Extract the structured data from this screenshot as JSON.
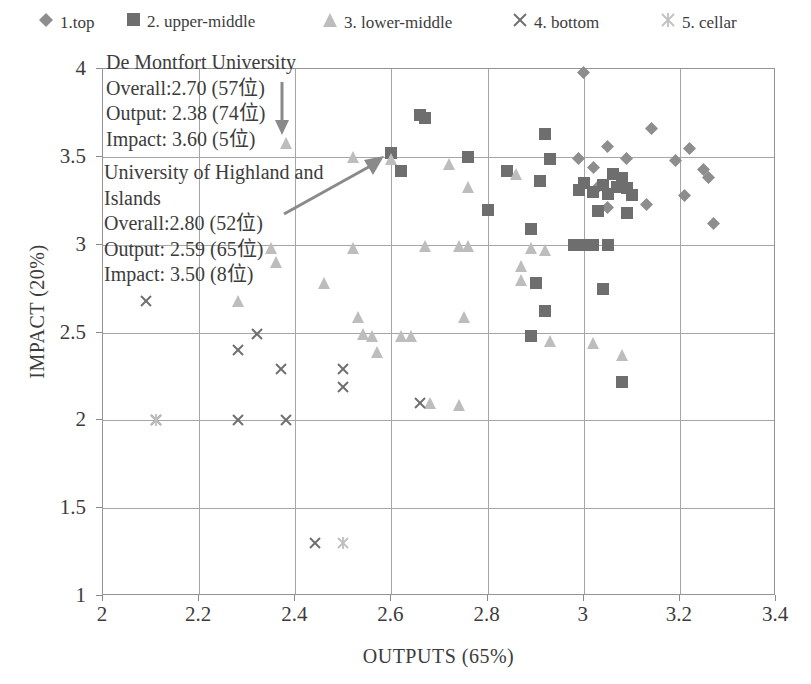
{
  "legend": {
    "items": [
      {
        "label": "1.top",
        "marker": "diamond-marker",
        "color": "#8d8d8d",
        "x": 38
      },
      {
        "label": "2. upper-middle",
        "marker": "square-marker",
        "color": "#6e6e6e",
        "x": 126
      },
      {
        "label": "3. lower-middle",
        "marker": "triangle-marker",
        "color": "#bdbdbd",
        "x": 322
      },
      {
        "label": "4. bottom",
        "marker": "cross-marker",
        "color": "#6f6f6f",
        "x": 512
      },
      {
        "label": "5. cellar",
        "marker": "asterisk-marker",
        "color": "#bfbfbf",
        "x": 660
      }
    ]
  },
  "annotations": [
    {
      "name": "de-montfort-university",
      "lines": [
        "De Montfort University",
        "Overall:2.70 (57位)",
        "Output: 2.38 (74位)",
        "Impact: 3.60 (5位)"
      ]
    },
    {
      "name": "university-of-highland-and-islands",
      "lines": [
        "University of Highland and",
        "Islands",
        "Overall:2.80 (52位)",
        "Output: 2.59 (65位)",
        "Impact: 3.50 (8位)"
      ]
    }
  ],
  "chart_data": {
    "type": "scatter",
    "title": "",
    "xlabel": "OUTPUTS (65%)",
    "ylabel": "IMPACT (20%)",
    "xlim": [
      2,
      3.4
    ],
    "ylim": [
      1,
      4
    ],
    "xticks": [
      2,
      2.2,
      2.4,
      2.6,
      2.8,
      3,
      3.2,
      3.4
    ],
    "xtick_labels": [
      "2",
      "2.2",
      "2.4",
      "2.6",
      "2.8",
      "3",
      "3.2",
      "3.4"
    ],
    "yticks": [
      1,
      1.5,
      2,
      2.5,
      3,
      3.5,
      4
    ],
    "ytick_labels": [
      "1",
      "1.5",
      "2",
      "2.5",
      "3",
      "3.5",
      "4"
    ],
    "grid": true,
    "legend_position": "top",
    "series": [
      {
        "name": "1.top",
        "marker": "diamond",
        "color": "#8d8d8d",
        "points": [
          [
            3.0,
            3.98
          ],
          [
            3.14,
            3.66
          ],
          [
            3.05,
            3.56
          ],
          [
            3.22,
            3.55
          ],
          [
            2.99,
            3.49
          ],
          [
            3.09,
            3.49
          ],
          [
            3.19,
            3.48
          ],
          [
            3.02,
            3.44
          ],
          [
            3.25,
            3.43
          ],
          [
            3.26,
            3.38
          ],
          [
            3.03,
            3.33
          ],
          [
            3.21,
            3.28
          ],
          [
            3.13,
            3.23
          ],
          [
            3.05,
            3.21
          ],
          [
            3.27,
            3.12
          ]
        ]
      },
      {
        "name": "2. upper-middle",
        "marker": "square",
        "color": "#6e6e6e",
        "points": [
          [
            2.66,
            3.74
          ],
          [
            2.67,
            3.72
          ],
          [
            2.92,
            3.63
          ],
          [
            2.6,
            3.52
          ],
          [
            2.76,
            3.5
          ],
          [
            2.93,
            3.49
          ],
          [
            2.62,
            3.42
          ],
          [
            2.84,
            3.42
          ],
          [
            3.06,
            3.4
          ],
          [
            3.08,
            3.38
          ],
          [
            2.91,
            3.36
          ],
          [
            3.0,
            3.35
          ],
          [
            3.04,
            3.34
          ],
          [
            3.07,
            3.33
          ],
          [
            3.09,
            3.32
          ],
          [
            2.99,
            3.31
          ],
          [
            3.02,
            3.3
          ],
          [
            3.05,
            3.29
          ],
          [
            3.1,
            3.28
          ],
          [
            2.8,
            3.2
          ],
          [
            3.03,
            3.19
          ],
          [
            3.09,
            3.18
          ],
          [
            2.89,
            3.09
          ],
          [
            2.98,
            3.0
          ],
          [
            3.0,
            3.0
          ],
          [
            3.02,
            3.0
          ],
          [
            3.05,
            3.0
          ],
          [
            2.9,
            2.78
          ],
          [
            3.04,
            2.75
          ],
          [
            2.92,
            2.62
          ],
          [
            2.89,
            2.48
          ],
          [
            3.08,
            2.22
          ]
        ]
      },
      {
        "name": "3. lower-middle",
        "marker": "triangle",
        "color": "#bdbdbd",
        "points": [
          [
            2.38,
            3.58
          ],
          [
            2.52,
            3.5
          ],
          [
            2.6,
            3.49
          ],
          [
            2.72,
            3.46
          ],
          [
            2.86,
            3.4
          ],
          [
            2.76,
            3.33
          ],
          [
            2.35,
            2.98
          ],
          [
            2.52,
            2.98
          ],
          [
            2.67,
            2.99
          ],
          [
            2.74,
            2.99
          ],
          [
            2.76,
            2.99
          ],
          [
            2.89,
            2.98
          ],
          [
            2.92,
            2.97
          ],
          [
            2.36,
            2.9
          ],
          [
            2.87,
            2.88
          ],
          [
            2.46,
            2.78
          ],
          [
            2.87,
            2.8
          ],
          [
            2.28,
            2.68
          ],
          [
            2.53,
            2.59
          ],
          [
            2.75,
            2.59
          ],
          [
            2.54,
            2.49
          ],
          [
            2.56,
            2.48
          ],
          [
            2.62,
            2.48
          ],
          [
            2.64,
            2.48
          ],
          [
            2.57,
            2.39
          ],
          [
            2.93,
            2.45
          ],
          [
            3.02,
            2.44
          ],
          [
            3.08,
            2.37
          ],
          [
            2.68,
            2.1
          ],
          [
            2.74,
            2.09
          ]
        ]
      },
      {
        "name": "4. bottom",
        "marker": "cross",
        "color": "#6f6f6f",
        "points": [
          [
            2.09,
            2.68
          ],
          [
            2.32,
            2.49
          ],
          [
            2.28,
            2.4
          ],
          [
            2.37,
            2.29
          ],
          [
            2.5,
            2.29
          ],
          [
            2.5,
            2.19
          ],
          [
            2.11,
            2.0
          ],
          [
            2.28,
            2.0
          ],
          [
            2.38,
            2.0
          ],
          [
            2.44,
            1.3
          ],
          [
            2.66,
            2.1
          ]
        ]
      },
      {
        "name": "5. cellar",
        "marker": "asterisk",
        "color": "#bfbfbf",
        "points": [
          [
            2.11,
            2.0
          ],
          [
            2.5,
            1.3
          ]
        ]
      }
    ]
  }
}
